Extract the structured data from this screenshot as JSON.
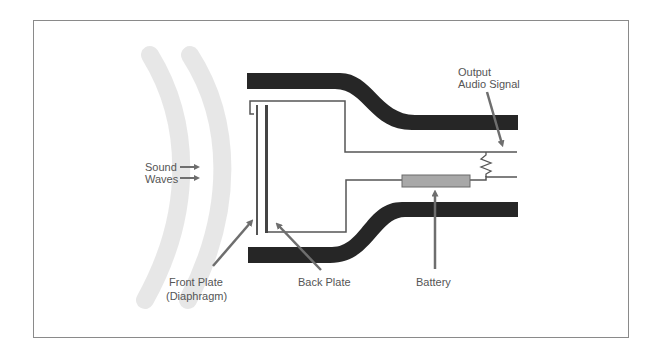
{
  "diagram": {
    "colors": {
      "housing": "#262626",
      "lines": "#555555",
      "arrow": "#6e6e6e",
      "battery": "#a8a8a8",
      "waves": "#e2e2e2",
      "frame": "#8a8a8a",
      "text": "#555555"
    },
    "labels": {
      "sound_waves_line1": "Sound",
      "sound_waves_line2": "Waves",
      "output_line1": "Output",
      "output_line2": "Audio Signal",
      "front_plate_line1": "Front Plate",
      "front_plate_line2": "(Diaphragm)",
      "back_plate": "Back Plate",
      "battery": "Battery"
    },
    "components": [
      {
        "name": "Sound Waves",
        "icon": "sound-wave-arcs"
      },
      {
        "name": "Front Plate (Diaphragm)",
        "icon": "thin-plate"
      },
      {
        "name": "Back Plate",
        "icon": "thick-plate"
      },
      {
        "name": "Battery",
        "icon": "battery-rectangle"
      },
      {
        "name": "Output Audio Signal",
        "icon": "resistor-zigzag"
      },
      {
        "name": "Housing",
        "icon": "housing-shell"
      }
    ]
  }
}
